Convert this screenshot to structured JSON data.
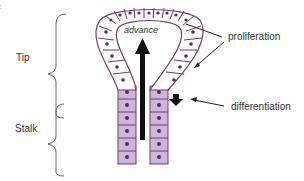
{
  "diagram": {
    "labels": {
      "tip": "Tip",
      "stalk": "Stalk",
      "advance": "advance",
      "proliferation": "proliferation",
      "differentiation": "differentiation",
      "clipped_top_line1": "ft",
      "clipped_top_line2": ")"
    },
    "colors": {
      "cell_outline": "#7a3a6a",
      "tip_cell_fill": "#ffffff",
      "stalk_cell_fill": "#c9b8d8",
      "nucleus": "#6a2050",
      "arrow": "#111111",
      "text": "#333333"
    }
  }
}
